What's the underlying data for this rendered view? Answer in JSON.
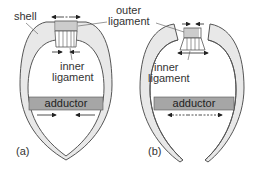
{
  "labels": {
    "shell": "shell",
    "outer_ligament_line1": "outer",
    "outer_ligament_line2": "ligament",
    "inner_ligament_a_line1": "inner",
    "inner_ligament_a_line2": "ligament",
    "inner_ligament_b_line1": "inner",
    "inner_ligament_b_line2": "ligament",
    "adductor_a": "adductor",
    "adductor_b": "adductor",
    "panel_a": "(a)",
    "panel_b": "(b)"
  },
  "colors": {
    "shell_fill": "#e8e8e8",
    "outline": "#555555",
    "adductor_fill": "#a6a6a6",
    "text": "#333333"
  }
}
